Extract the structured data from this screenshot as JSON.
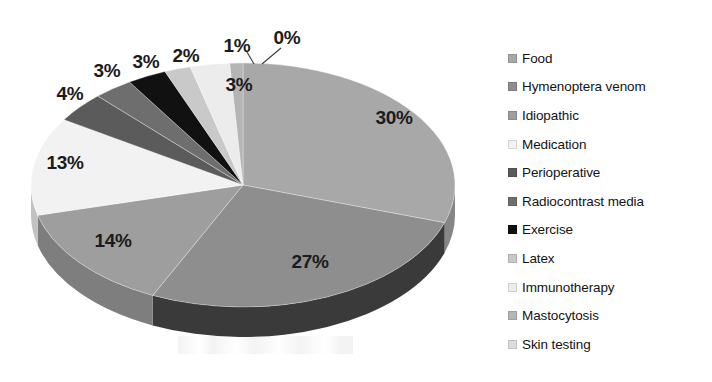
{
  "chart_data": {
    "type": "pie",
    "title": "",
    "subtitle": "",
    "xlabel": "",
    "ylabel": "",
    "grid": false,
    "three_d": true,
    "legend_position": "right",
    "value_unit": "%",
    "labels_shown_on_slices": true,
    "categories": [
      "Food",
      "Hymenoptera venom",
      "Idiopathic",
      "Medication",
      "Perioperative",
      "Radiocontrast media",
      "Exercise",
      "Latex",
      "Immunotherapy",
      "Mastocytosis",
      "Skin testing"
    ],
    "values": [
      30,
      27,
      14,
      13,
      4,
      3,
      3,
      2,
      3,
      1,
      0
    ],
    "value_labels": [
      "30%",
      "27%",
      "14%",
      "13%",
      "4%",
      "3%",
      "3%",
      "2%",
      "3%",
      "1%",
      "0%"
    ],
    "colors": [
      "#a8a8a8",
      "#8e8e8e",
      "#9e9e9e",
      "#f2f2f2",
      "#5b5b5b",
      "#6e6e6e",
      "#111111",
      "#c9c9c9",
      "#ececec",
      "#b5b5b5",
      "#dcdcdc"
    ],
    "side_colors": [
      "#868686",
      "#3a3a3a",
      "#7e7e7e",
      "#c2c2c2",
      "#484848",
      "#585858",
      "#0d0d0d",
      "#a0a0a0",
      "#bcbcbc",
      "#909090",
      "#b0b0b0"
    ],
    "slices": [
      {
        "label": "Food",
        "value": 30,
        "value_label": "30%",
        "color": "#a8a8a8"
      },
      {
        "label": "Hymenoptera venom",
        "value": 27,
        "value_label": "27%",
        "color": "#8e8e8e"
      },
      {
        "label": "Idiopathic",
        "value": 14,
        "value_label": "14%",
        "color": "#9e9e9e"
      },
      {
        "label": "Medication",
        "value": 13,
        "value_label": "13%",
        "color": "#f2f2f2"
      },
      {
        "label": "Perioperative",
        "value": 4,
        "value_label": "4%",
        "color": "#5b5b5b"
      },
      {
        "label": "Radiocontrast media",
        "value": 3,
        "value_label": "3%",
        "color": "#6e6e6e"
      },
      {
        "label": "Exercise",
        "value": 3,
        "value_label": "3%",
        "color": "#111111"
      },
      {
        "label": "Latex",
        "value": 2,
        "value_label": "2%",
        "color": "#c9c9c9"
      },
      {
        "label": "Immunotherapy",
        "value": 3,
        "value_label": "3%",
        "color": "#ececec"
      },
      {
        "label": "Mastocytosis",
        "value": 1,
        "value_label": "1%",
        "color": "#b5b5b5"
      },
      {
        "label": "Skin testing",
        "value": 0,
        "value_label": "0%",
        "color": "#dcdcdc"
      }
    ]
  },
  "pie_geometry": {
    "center_x": 243,
    "center_y": 185,
    "radius_x": 212,
    "radius_y": 122,
    "depth": 30,
    "start_angle_deg": -90,
    "direction": "clockwise"
  },
  "slice_labels": [
    {
      "text": "30%",
      "x": 394,
      "y": 118
    },
    {
      "text": "27%",
      "x": 310,
      "y": 262
    },
    {
      "text": "14%",
      "x": 113,
      "y": 241
    },
    {
      "text": "13%",
      "x": 65,
      "y": 163
    },
    {
      "text": "4%",
      "x": 70,
      "y": 94
    },
    {
      "text": "3%",
      "x": 107,
      "y": 71
    },
    {
      "text": "3%",
      "x": 146,
      "y": 62
    },
    {
      "text": "2%",
      "x": 186,
      "y": 56
    },
    {
      "text": "3%",
      "x": 239,
      "y": 85
    },
    {
      "text": "1%",
      "x": 237,
      "y": 46
    },
    {
      "text": "0%",
      "x": 287,
      "y": 38
    }
  ],
  "leader_lines": [
    {
      "name": "mastocytosis-leader",
      "x1": 247,
      "y1": 52,
      "x2": 254,
      "y2": 64
    },
    {
      "name": "skin-testing-leader",
      "x1": 281,
      "y1": 48,
      "x2": 262,
      "y2": 64
    }
  ],
  "legend": {
    "items": [
      {
        "label": "Food",
        "color": "#a8a8a8"
      },
      {
        "label": "Hymenoptera venom",
        "color": "#8e8e8e"
      },
      {
        "label": "Idiopathic",
        "color": "#9e9e9e"
      },
      {
        "label": "Medication",
        "color": "#f2f2f2"
      },
      {
        "label": "Perioperative",
        "color": "#5b5b5b"
      },
      {
        "label": "Radiocontrast media",
        "color": "#6e6e6e"
      },
      {
        "label": "Exercise",
        "color": "#111111"
      },
      {
        "label": "Latex",
        "color": "#c9c9c9"
      },
      {
        "label": "Immunotherapy",
        "color": "#ececec"
      },
      {
        "label": "Mastocytosis",
        "color": "#b5b5b5"
      },
      {
        "label": "Skin testing",
        "color": "#dcdcdc"
      }
    ]
  }
}
